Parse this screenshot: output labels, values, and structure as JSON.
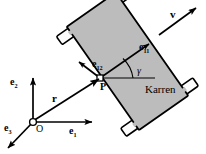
{
  "figure": {
    "background_color": "#ffffff",
    "width": 206,
    "height": 154
  },
  "colors": {
    "body_fill": "#bcbcbc",
    "body_stroke": "#000000",
    "wheel_fill": "#fcfcfc",
    "wheel_stroke": "#000000",
    "line": "#000000",
    "point_fill": "#ffffff",
    "text": "#000000"
  },
  "labels": {
    "e1": {
      "base": "e",
      "sub": "1",
      "text": "e1"
    },
    "e2": {
      "base": "e",
      "sub": "2",
      "text": "e2"
    },
    "e3": {
      "base": "e",
      "sub": "3",
      "text": "e3"
    },
    "e11": {
      "base": "e",
      "sub": "11",
      "text": "e11"
    },
    "e12": {
      "base": "e",
      "sub": "12",
      "text": "e12"
    },
    "r": {
      "text": "r"
    },
    "v": {
      "text": "v"
    },
    "origin": {
      "text": "O"
    },
    "point_p": {
      "text": "P"
    },
    "gamma": {
      "text": "γ"
    },
    "body_name": {
      "text": "Karren"
    }
  },
  "geometry": {
    "origin": {
      "x": 32,
      "y": 122
    },
    "point_p": {
      "x": 100,
      "y": 78
    },
    "body_angle_deg": -35,
    "inertial_axes": [
      {
        "name": "e1",
        "dir": "right"
      },
      {
        "name": "e2",
        "dir": "up"
      },
      {
        "name": "e3",
        "dir": "down-left"
      }
    ],
    "body_axes": [
      {
        "name": "e11",
        "dir": "along-body-forward"
      },
      {
        "name": "e12",
        "dir": "body-left"
      }
    ],
    "wheels": 4,
    "angle_marked": "gamma between e1 direction and e11"
  }
}
